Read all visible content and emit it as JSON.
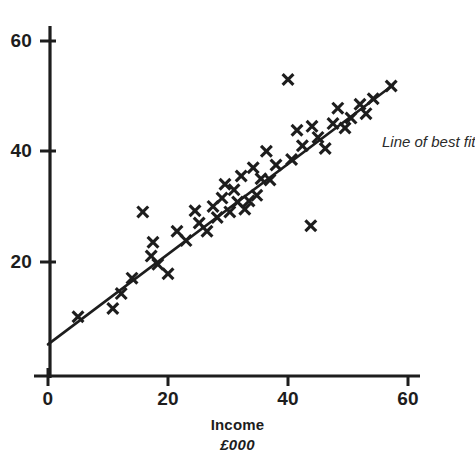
{
  "chart_data": {
    "type": "scatter",
    "title": "",
    "xlabel": "Income",
    "xlabel_units": "£000",
    "ylabel": "",
    "xlim": [
      0,
      62
    ],
    "ylim": [
      0,
      64
    ],
    "xticks": [
      0,
      20,
      40,
      60
    ],
    "yticks": [
      20,
      40,
      60
    ],
    "xtick_labels": [
      "0",
      "20",
      "40",
      "60"
    ],
    "ytick_labels": [
      "20",
      "40",
      "60"
    ],
    "grid": false,
    "marker": "x",
    "marker_color": "#1d1d1d",
    "legend_position": "none",
    "annotations": [
      {
        "text": "Line of best fit",
        "x": 58.5,
        "y": 43.5,
        "clipped_at_right_edge": true
      }
    ],
    "series": [
      {
        "name": "Expenditure vs Income",
        "type": "scatter",
        "points": [
          [
            5.0,
            10.0
          ],
          [
            10.8,
            11.5
          ],
          [
            12.2,
            14.2
          ],
          [
            14.0,
            17.0
          ],
          [
            15.8,
            29.0
          ],
          [
            17.2,
            21.0
          ],
          [
            17.5,
            23.5
          ],
          [
            18.3,
            19.5
          ],
          [
            20.0,
            17.8
          ],
          [
            21.5,
            25.5
          ],
          [
            23.0,
            23.8
          ],
          [
            24.5,
            29.2
          ],
          [
            25.2,
            27.0
          ],
          [
            26.5,
            25.5
          ],
          [
            27.5,
            30.0
          ],
          [
            28.2,
            28.0
          ],
          [
            29.0,
            31.5
          ],
          [
            29.5,
            34.0
          ],
          [
            30.3,
            29.0
          ],
          [
            31.0,
            33.0
          ],
          [
            31.6,
            30.8
          ],
          [
            32.2,
            35.5
          ],
          [
            32.8,
            29.5
          ],
          [
            33.5,
            31.0
          ],
          [
            34.2,
            37.0
          ],
          [
            34.8,
            32.0
          ],
          [
            35.5,
            35.0
          ],
          [
            36.4,
            40.0
          ],
          [
            37.0,
            34.8
          ],
          [
            38.0,
            37.5
          ],
          [
            40.0,
            53.0
          ],
          [
            40.6,
            38.5
          ],
          [
            41.5,
            43.8
          ],
          [
            42.4,
            41.0
          ],
          [
            43.8,
            26.5
          ],
          [
            44.0,
            44.5
          ],
          [
            45.0,
            42.5
          ],
          [
            46.2,
            40.5
          ],
          [
            47.5,
            45.0
          ],
          [
            48.3,
            47.8
          ],
          [
            49.5,
            44.2
          ],
          [
            50.5,
            46.0
          ],
          [
            52.0,
            48.5
          ],
          [
            53.0,
            46.8
          ],
          [
            54.2,
            49.5
          ],
          [
            57.2,
            51.8
          ]
        ]
      },
      {
        "name": "Line of best fit",
        "type": "line",
        "endpoints": [
          [
            0.0,
            5.0
          ],
          [
            57.5,
            52.0
          ]
        ]
      }
    ]
  },
  "axes": {
    "y_axis_name": "y-axis",
    "x_axis_name": "x-axis"
  }
}
